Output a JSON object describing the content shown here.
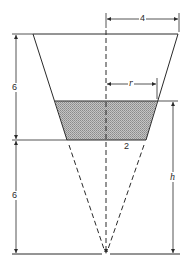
{
  "diagram": {
    "type": "truncated-cone-tank-cross-section",
    "labels": {
      "top_radius": "4",
      "liquid_radius": "r",
      "frustum_height": "6",
      "cone_extension_height": "6",
      "bottom_radius": "2",
      "liquid_depth": "h"
    },
    "colors": {
      "line": "#2a2a2a",
      "liquid_fill": "#b8b8b8",
      "background": "#ffffff"
    }
  }
}
